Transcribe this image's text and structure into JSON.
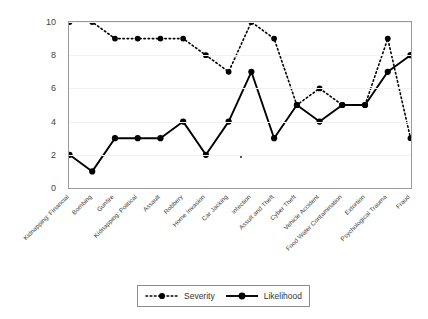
{
  "chart_data": {
    "type": "line",
    "title": "",
    "xlabel": "",
    "ylabel": "",
    "ylim": [
      0,
      10
    ],
    "yticks": [
      0,
      2,
      4,
      6,
      8,
      10
    ],
    "grid": true,
    "legend_position": "bottom-center",
    "categories": [
      "Kidnapping: Financial",
      "Bombing",
      "Gunfire",
      "Kidnapping: Political",
      "Assault",
      "Robbery",
      "Home Invasion",
      "Car Jacking",
      "Infection",
      "Assult and Theft",
      "Cyber Theft",
      "Vehicle Accident",
      "Food Water Contamination",
      "Extortion",
      "Psychological Trauma",
      "Fraud"
    ],
    "series": [
      {
        "name": "Severity",
        "style": "dotted",
        "color": "#000000",
        "values": [
          10,
          10,
          9,
          9,
          9,
          9,
          8,
          7,
          10,
          9,
          5,
          6,
          5,
          5,
          9,
          3
        ]
      },
      {
        "name": "Likelihood",
        "style": "solid",
        "color": "#000000",
        "values": [
          2,
          1,
          3,
          3,
          3,
          4,
          2,
          4,
          7,
          3,
          5,
          4,
          5,
          5,
          7,
          8
        ]
      }
    ]
  },
  "legend": {
    "items": [
      {
        "label": "Severity"
      },
      {
        "label": "Likelihood"
      }
    ]
  }
}
